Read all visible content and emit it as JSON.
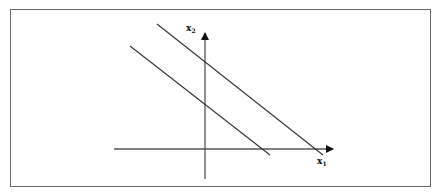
{
  "figure": {
    "axes": {
      "x_label": "x",
      "x_subscript": "1",
      "y_label": "x",
      "y_subscript": "2",
      "origin": [
        205,
        149
      ],
      "x_axis": {
        "from": [
          114,
          149
        ],
        "to": [
          333,
          149
        ]
      },
      "y_axis": {
        "from": [
          205,
          179
        ],
        "to": [
          205,
          33
        ]
      }
    },
    "lines": [
      {
        "name": "inner-line",
        "from": [
          130,
          46
        ],
        "to": [
          270,
          155
        ]
      },
      {
        "name": "outer-line",
        "from": [
          157,
          24
        ],
        "to": [
          323,
          155
        ]
      }
    ],
    "colors": {
      "line": "#333333",
      "frame": "#6a6a6a"
    }
  }
}
